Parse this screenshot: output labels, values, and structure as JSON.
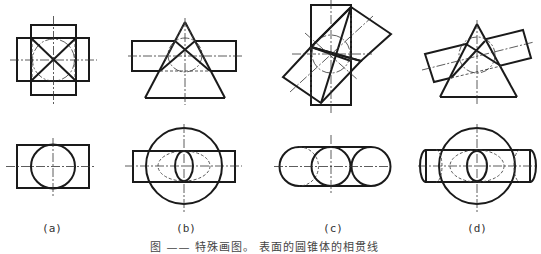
{
  "figure": {
    "caption": "图 ——  特殊画图。 表面的圆锥体的相贯线",
    "panels": [
      {
        "id": "a",
        "label": "(a)",
        "description": "two perpendicular cylinders of equal diameter — front view with X-shaped intersection lines; top view circle inside rectangle"
      },
      {
        "id": "b",
        "label": "(b)",
        "description": "cone intersected by horizontal cylinder tangent to common sphere — straight-line intersections; top view circle with ellipse"
      },
      {
        "id": "c",
        "label": "(c)",
        "description": "two cylinders at an oblique angle sharing an inscribed sphere — straight-line intersections; top view three circles in capsule"
      },
      {
        "id": "d",
        "label": "(d)",
        "description": "cone intersected by inclined cylinder tangent to common sphere; top view circle with ellipses"
      }
    ]
  },
  "colors": {
    "line": "#1a1a1a",
    "background": "#ffffff"
  }
}
